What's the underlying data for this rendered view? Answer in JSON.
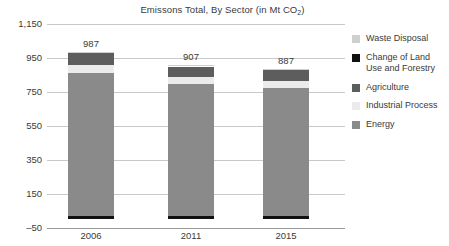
{
  "chart_data": {
    "type": "bar",
    "subtype": "stacked-bar",
    "title": "Emissons Total, By Sector (in Mt CO2)",
    "title_main": "Emissons Total, By Sector (in Mt CO",
    "title_sub": "2",
    "title_tail": ")",
    "xlabel": "",
    "ylabel": "",
    "categories": [
      "2006",
      "2011",
      "2015"
    ],
    "totals": [
      987,
      907,
      887
    ],
    "ylim": [
      -50,
      1150
    ],
    "yticks": [
      1150,
      950,
      750,
      550,
      350,
      150,
      -50
    ],
    "ytick_labels": [
      "1,150",
      "950",
      "750",
      "550",
      "350",
      "150",
      "–50"
    ],
    "grid": true,
    "legend_position": "right",
    "series": [
      {
        "name": "Waste Disposal",
        "color": "#cfcfcf",
        "values": [
          8,
          7,
          7
        ]
      },
      {
        "name": "Change of Land Use and Forestry",
        "color": "#111111",
        "values": [
          22,
          20,
          20
        ]
      },
      {
        "name": "Agriculture",
        "color": "#5d5d5d",
        "values": [
          70,
          62,
          64
        ]
      },
      {
        "name": "Industrial Process",
        "color": "#ebebeb",
        "values": [
          45,
          43,
          44
        ]
      },
      {
        "name": "Energy",
        "color": "#8a8a8a",
        "values": [
          842,
          775,
          752
        ]
      }
    ],
    "stack_order_top_to_bottom": [
      "Waste Disposal",
      "Agriculture",
      "Industrial Process",
      "Energy",
      "Change of Land Use and Forestry"
    ]
  },
  "legend": {
    "items": [
      {
        "label": "Waste Disposal",
        "color": "#cfcfcf"
      },
      {
        "label": "Change of Land Use and Forestry",
        "color": "#111111"
      },
      {
        "label": "Agriculture",
        "color": "#5d5d5d"
      },
      {
        "label": "Industrial Process",
        "color": "#ebebeb"
      },
      {
        "label": "Energy",
        "color": "#8a8a8a"
      }
    ]
  },
  "colors": {
    "gridline": "#c9c9c9",
    "axis": "#9a9a9a",
    "text": "#3a3a3a",
    "background": "#ffffff"
  }
}
